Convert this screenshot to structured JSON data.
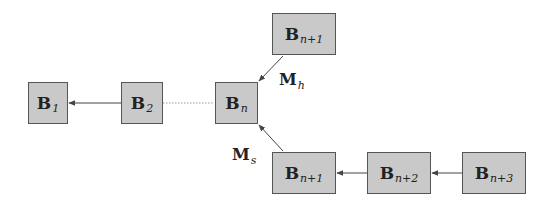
{
  "diagram": {
    "nodes": [
      {
        "id": "b1",
        "main": "B",
        "sub": "1"
      },
      {
        "id": "b2",
        "main": "B",
        "sub": "2"
      },
      {
        "id": "bn",
        "main": "B",
        "sub": "n"
      },
      {
        "id": "bn1_top",
        "main": "B",
        "sub": "n+1"
      },
      {
        "id": "bn1_bottom",
        "main": "B",
        "sub": "n+1"
      },
      {
        "id": "bn2",
        "main": "B",
        "sub": "n+2"
      },
      {
        "id": "bn3",
        "main": "B",
        "sub": "n+3"
      }
    ],
    "edges": [
      {
        "from": "b2",
        "to": "b1",
        "style": "solid-arrow"
      },
      {
        "from": "bn",
        "to": "b2",
        "style": "dotted"
      },
      {
        "from": "bn1_top",
        "to": "bn",
        "style": "solid-arrow",
        "label": "M_h"
      },
      {
        "from": "bn1_bottom",
        "to": "bn",
        "style": "solid-arrow",
        "label": "M_s"
      },
      {
        "from": "bn2",
        "to": "bn1_bottom",
        "style": "solid-arrow"
      },
      {
        "from": "bn3",
        "to": "bn2",
        "style": "solid-arrow"
      }
    ],
    "labels": {
      "mh": {
        "main": "M",
        "sub": "h"
      },
      "ms": {
        "main": "M",
        "sub": "s"
      }
    },
    "colors": {
      "node_fill": "#c9c9c9",
      "node_border": "#555555",
      "edge": "#444444",
      "dotted_edge": "#9a9a9a"
    }
  }
}
